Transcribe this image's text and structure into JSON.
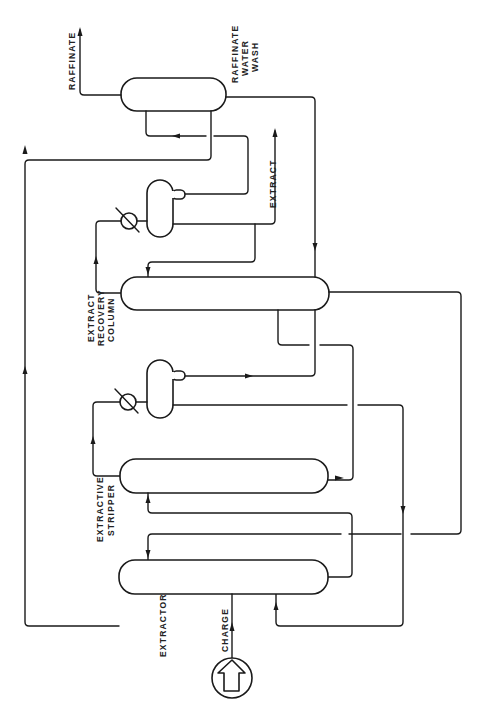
{
  "diagram": {
    "title": "",
    "labels": {
      "raffinate": "RAFFINATE",
      "raffinate_water_wash_1": "RAFFINATE",
      "raffinate_water_wash_2": "WATER",
      "raffinate_water_wash_3": "WASH",
      "extract": "EXTRACT",
      "extract_recovery_column_1": "EXTRACT",
      "extract_recovery_column_2": "RECOVERY",
      "extract_recovery_column_3": "COLUMN",
      "extractive_stripper_1": "EXTRACTIVE",
      "extractive_stripper_2": "STRIPPER",
      "extractor": "EXTRACTOR",
      "charge": "CHARGE"
    },
    "nodes": [
      {
        "id": "raffinate-water-wash",
        "label": "RAFFINATE WATER WASH",
        "shape": "horizontal-vessel"
      },
      {
        "id": "extract-recovery-column",
        "label": "EXTRACT RECOVERY COLUMN",
        "shape": "horizontal-vessel"
      },
      {
        "id": "extractive-stripper",
        "label": "EXTRACTIVE STRIPPER",
        "shape": "horizontal-vessel"
      },
      {
        "id": "extractor",
        "label": "EXTRACTOR",
        "shape": "horizontal-vessel"
      },
      {
        "id": "recovery-condenser",
        "label": "",
        "shape": "heat-exchanger"
      },
      {
        "id": "recovery-accumulator",
        "label": "",
        "shape": "drum-with-boot"
      },
      {
        "id": "stripper-condenser",
        "label": "",
        "shape": "heat-exchanger"
      },
      {
        "id": "stripper-accumulator",
        "label": "",
        "shape": "drum-with-boot"
      },
      {
        "id": "charge-feed",
        "label": "CHARGE",
        "shape": "feed-symbol"
      }
    ],
    "streams": [
      {
        "from": "charge-feed",
        "to": "extractor",
        "label": "CHARGE"
      },
      {
        "from": "extractor",
        "to": "extractive-stripper",
        "label": ""
      },
      {
        "from": "extractor",
        "to": "raffinate-water-wash",
        "label": ""
      },
      {
        "from": "raffinate-water-wash",
        "to": "raffinate-out",
        "label": "RAFFINATE"
      },
      {
        "from": "raffinate-water-wash",
        "to": "extract-recovery-column",
        "label": ""
      },
      {
        "from": "extractive-stripper",
        "to": "stripper-condenser",
        "label": ""
      },
      {
        "from": "stripper-condenser",
        "to": "stripper-accumulator",
        "label": ""
      },
      {
        "from": "stripper-accumulator",
        "to": "extractor",
        "label": ""
      },
      {
        "from": "stripper-accumulator",
        "to": "extract-recovery-column",
        "label": ""
      },
      {
        "from": "extractive-stripper",
        "to": "extract-recovery-column",
        "label": ""
      },
      {
        "from": "extract-recovery-column",
        "to": "recovery-condenser",
        "label": ""
      },
      {
        "from": "recovery-condenser",
        "to": "recovery-accumulator",
        "label": ""
      },
      {
        "from": "recovery-accumulator",
        "to": "extract-out",
        "label": "EXTRACT"
      },
      {
        "from": "recovery-accumulator",
        "to": "raffinate-water-wash",
        "label": ""
      },
      {
        "from": "extract-recovery-column",
        "to": "extractor",
        "label": ""
      }
    ],
    "colors": {
      "line": "#1a1a1a",
      "background": "#ffffff"
    }
  }
}
